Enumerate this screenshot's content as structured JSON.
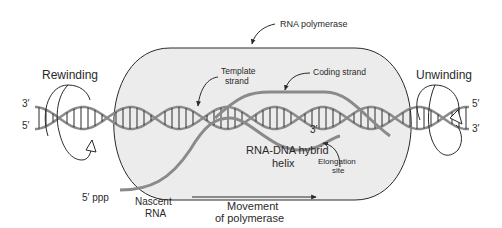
{
  "diagram": {
    "labels": {
      "rna_polymerase": "RNA polymerase",
      "rewinding": "Rewinding",
      "unwinding": "Unwinding",
      "template_strand_line1": "Template",
      "template_strand_line2": "strand",
      "coding_strand": "Coding strand",
      "hybrid_line1": "RNA-DNA hybrid",
      "hybrid_line2": "helix",
      "elongation_line1": "Elongation",
      "elongation_line2": "site",
      "three_prime_rna": "3′",
      "five_prime_ppp": "5′ ppp",
      "nascent_line1": "Nascent",
      "nascent_line2": "RNA",
      "movement_line1": "Movement",
      "movement_line2": "of polymerase",
      "left_top_end": "3′",
      "left_bottom_end": "5′",
      "right_top_end": "5′",
      "right_bottom_end": "3′"
    },
    "colors": {
      "polymerase_fill": "#ececec",
      "outline": "#2a2a2a",
      "dna_strand": "#8a8a8a",
      "rna_strand": "#8a8a8a",
      "rungs": "#2a2a2a"
    }
  }
}
